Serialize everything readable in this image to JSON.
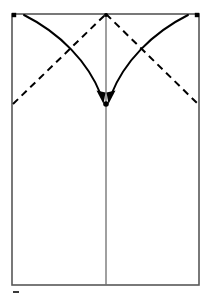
{
  "figure": {
    "type": "origami-instruction-diagram",
    "canvas": {
      "width": 211,
      "height": 297
    },
    "background_color": "#ffffff"
  },
  "colors": {
    "paper_outline": "#585858",
    "crease_line": "#6d6d6d",
    "fold_line": "#000000",
    "arrow": "#000000",
    "marker_dot": "#000000",
    "tick_mark": "#3a3a3a"
  },
  "paper": {
    "name": "paper-sheet-rectangle",
    "left": 12,
    "top": 14,
    "right": 199,
    "bottom": 285,
    "stroke_width": 1.6
  },
  "center_crease": {
    "name": "vertical-center-crease",
    "x": 106,
    "y_top": 14,
    "y_bottom": 285,
    "stroke_width": 1.3,
    "style": "solid"
  },
  "fold_lines": [
    {
      "name": "valley-fold-left",
      "style": "dashed",
      "dash_pattern": "7 5",
      "stroke_width": 2.0,
      "from": {
        "x": 13,
        "y": 104
      },
      "to": {
        "x": 106,
        "y": 14
      }
    },
    {
      "name": "valley-fold-right",
      "style": "dashed",
      "dash_pattern": "7 5",
      "stroke_width": 2.0,
      "from": {
        "x": 106,
        "y": 14
      },
      "to": {
        "x": 198,
        "y": 104
      }
    }
  ],
  "arrows": [
    {
      "name": "fold-arrow-left",
      "description": "curved arrow from top-left corner to center point",
      "path": "M 24,15 C 60,33 88,62 101,95",
      "stroke_width": 2.0,
      "head": {
        "x": 103,
        "y": 101,
        "angle": 70,
        "length": 13,
        "width": 7
      }
    },
    {
      "name": "fold-arrow-right",
      "description": "curved arrow from top-right corner to center point",
      "path": "M 188,15 C 152,33 124,62 111,95",
      "stroke_width": 2.0,
      "head": {
        "x": 109,
        "y": 101,
        "angle": 110,
        "length": 13,
        "width": 7
      }
    }
  ],
  "markers": [
    {
      "name": "corner-dot-top-left",
      "x": 14,
      "y": 15,
      "r": 2.2,
      "shape": "square"
    },
    {
      "name": "corner-dot-top-right",
      "x": 197,
      "y": 15,
      "r": 2.2,
      "shape": "square"
    },
    {
      "name": "apex-dot-top-center",
      "x": 106,
      "y": 15,
      "r": 2.0,
      "shape": "circle"
    },
    {
      "name": "target-dot-center",
      "x": 106,
      "y": 104,
      "r": 2.8,
      "shape": "circle"
    }
  ],
  "tick_mark": {
    "name": "page-tick-mark",
    "x": 13,
    "y": 292,
    "width": 6,
    "height": 2
  }
}
